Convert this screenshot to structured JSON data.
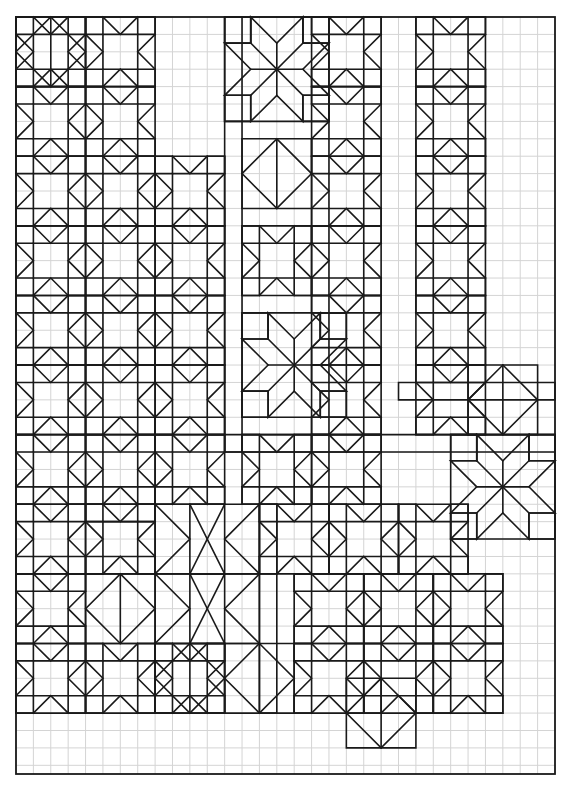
{
  "colors": {
    "ink": "#1a1a1a",
    "grid": "#d4d4d4",
    "paper": "#ffffff"
  },
  "grid": {
    "columns": 31,
    "rows": 43.5
  },
  "motifs": {
    "sawtooth_stars": [
      [
        0,
        0
      ],
      [
        4,
        0
      ],
      [
        17,
        0
      ],
      [
        23,
        0
      ],
      [
        0,
        4
      ],
      [
        4,
        4
      ],
      [
        17,
        4
      ],
      [
        23,
        4
      ],
      [
        0,
        8
      ],
      [
        4,
        8
      ],
      [
        8,
        8
      ],
      [
        17,
        8
      ],
      [
        23,
        8
      ],
      [
        0,
        12
      ],
      [
        4,
        12
      ],
      [
        8,
        12
      ],
      [
        13,
        12
      ],
      [
        17,
        12
      ],
      [
        23,
        12
      ],
      [
        0,
        16
      ],
      [
        4,
        16
      ],
      [
        8,
        16
      ],
      [
        17,
        16
      ],
      [
        23,
        16
      ],
      [
        0,
        20
      ],
      [
        4,
        20
      ],
      [
        8,
        20
      ],
      [
        17,
        20
      ],
      [
        23,
        20
      ],
      [
        0,
        24
      ],
      [
        4,
        24
      ],
      [
        8,
        24
      ],
      [
        13,
        24
      ],
      [
        17,
        24
      ],
      [
        0,
        28
      ],
      [
        4,
        28
      ],
      [
        14,
        28
      ],
      [
        18,
        28
      ],
      [
        22,
        28
      ],
      [
        0,
        32
      ],
      [
        16,
        32
      ],
      [
        20,
        32
      ],
      [
        24,
        32
      ],
      [
        0,
        36
      ],
      [
        4,
        36
      ],
      [
        8,
        36
      ],
      [
        16,
        36
      ],
      [
        20,
        36
      ],
      [
        24,
        36
      ],
      [
        0,
        40
      ],
      [
        4,
        40
      ],
      [
        8,
        40
      ],
      [
        12,
        40
      ],
      [
        16,
        40
      ],
      [
        24,
        40
      ]
    ],
    "partial_stars": [
      [
        0,
        0
      ],
      [
        13,
        7
      ],
      [
        26,
        20
      ],
      [
        4,
        32
      ],
      [
        8,
        36
      ],
      [
        12,
        36
      ],
      [
        19,
        38
      ]
    ],
    "lemoyne_stars": [
      [
        12,
        0
      ],
      [
        13,
        17
      ],
      [
        25,
        24
      ]
    ],
    "x_blocks": [
      [
        8,
        28
      ],
      [
        8,
        32
      ]
    ],
    "strips": [
      {
        "dir": "v",
        "col": 12,
        "row": 0,
        "len": 25
      },
      {
        "dir": "h",
        "col": 12,
        "row": 24,
        "len": 19
      },
      {
        "dir": "h",
        "col": 22,
        "row": 21,
        "len": 9
      },
      {
        "dir": "v",
        "col": 14,
        "row": 28,
        "len": 12
      },
      {
        "dir": "h",
        "col": 4,
        "row": 28,
        "len": 4
      }
    ]
  }
}
